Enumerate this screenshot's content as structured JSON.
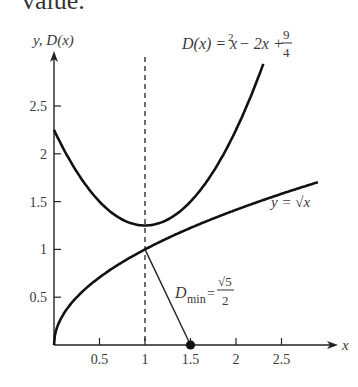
{
  "page": {
    "top_text": "value."
  },
  "chart_data": {
    "type": "line",
    "title": "",
    "xlabel": "x",
    "ylabel": "y, D(x)",
    "xlim": [
      0,
      3
    ],
    "ylim": [
      0,
      2.8
    ],
    "grid": false,
    "x_ticks": [
      0.5,
      1,
      1.5,
      2,
      2.5
    ],
    "x_tick_labels": [
      "0.5",
      "1",
      "1.5",
      "2",
      "2.5"
    ],
    "y_ticks": [
      0.5,
      1,
      1.5,
      2,
      2.5
    ],
    "y_tick_labels": [
      "0.5",
      "1",
      "1.5",
      "2",
      "2.5"
    ],
    "series": [
      {
        "name": "D(x) = x^2 - 2x + 9/4",
        "label": "D(x) = x² − 2x + 9/4",
        "function": "x^2 - 2x + 2.25",
        "x": [
          0,
          0.25,
          0.5,
          0.75,
          1,
          1.25,
          1.5,
          1.75,
          2,
          2.25,
          2.3
        ],
        "values": [
          2.25,
          1.8125,
          1.5,
          1.3125,
          1.25,
          1.3125,
          1.5,
          1.8125,
          2.25,
          2.8125,
          2.94
        ]
      },
      {
        "name": "y = sqrt(x)",
        "label": "y = √x",
        "function": "sqrt(x)",
        "x": [
          0,
          0.25,
          0.5,
          1,
          1.5,
          2,
          2.5,
          2.9
        ],
        "values": [
          0,
          0.5,
          0.707,
          1,
          1.225,
          1.414,
          1.581,
          1.703
        ]
      }
    ],
    "annotations": [
      {
        "type": "vline",
        "x": 1,
        "style": "dashed"
      },
      {
        "type": "segment",
        "from": [
          1,
          1
        ],
        "to": [
          1.5,
          0
        ],
        "label": "D_min = √5 / 2"
      },
      {
        "type": "point",
        "x": 1.5,
        "y": 0
      }
    ],
    "labels": {
      "d_eq_lhs": "D(x) = x",
      "d_eq_exp": "2",
      "d_eq_rest": " − 2x + ",
      "d_eq_num": "9",
      "d_eq_den": "4",
      "sqrt_label": "y = √x",
      "dmin_D": "D",
      "dmin_sub": "min",
      "dmin_eq": "=",
      "dmin_num": "√5",
      "dmin_den": "2",
      "y_axis_label": "y, D(x)",
      "x_axis_label": "x"
    }
  }
}
